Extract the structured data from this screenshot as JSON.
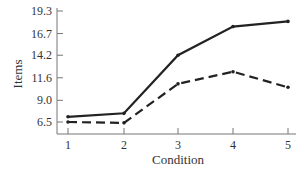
{
  "chart_data": {
    "type": "line",
    "title": "",
    "xlabel": "Condition",
    "ylabel": "Items",
    "categories": [
      1,
      2,
      3,
      4,
      5
    ],
    "x_ticks": [
      "1",
      "2",
      "3",
      "4",
      "5"
    ],
    "y_ticks": [
      "6.5",
      "9.0",
      "11.6",
      "14.2",
      "16.7",
      "19.3"
    ],
    "y_tick_values": [
      6.5,
      9.0,
      11.6,
      14.2,
      16.7,
      19.3
    ],
    "ylim": [
      5.1,
      19.3
    ],
    "grid": false,
    "legend": null,
    "series": [
      {
        "name": "Series 1 (solid)",
        "style": "solid",
        "color": "#222222",
        "values": [
          7.1,
          7.5,
          14.2,
          17.5,
          18.1
        ]
      },
      {
        "name": "Series 2 (dashed)",
        "style": "dashed",
        "color": "#222222",
        "values": [
          6.5,
          6.4,
          10.9,
          12.3,
          10.5
        ]
      }
    ]
  }
}
